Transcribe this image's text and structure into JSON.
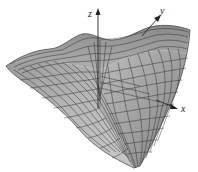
{
  "diagram": {
    "type": "3d-surface-plot",
    "axes": {
      "z": {
        "label": "z"
      },
      "y": {
        "label": "y"
      },
      "x": {
        "label": "x"
      }
    },
    "colors": {
      "surface_light": "#d8d8d8",
      "surface_mid": "#a8a8a8",
      "surface_dark": "#6e6e6e",
      "mesh_line": "#2a2a2a",
      "axis": "#222222",
      "background": "#ffffff"
    }
  }
}
